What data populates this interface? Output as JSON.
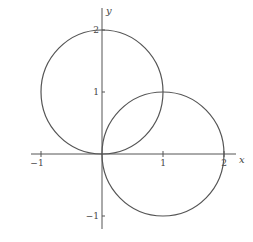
{
  "chart_data": {
    "type": "line",
    "title": "",
    "xlabel": "x",
    "ylabel": "y",
    "xlim": [
      -1.2,
      2.2
    ],
    "ylim": [
      -1.2,
      2.3
    ],
    "grid": false,
    "legend": null,
    "x_ticks": [
      {
        "value": -1,
        "label": "−1"
      },
      {
        "value": 1,
        "label": "1"
      },
      {
        "value": 2,
        "label": "2"
      }
    ],
    "y_ticks": [
      {
        "value": -1,
        "label": "−1"
      },
      {
        "value": 1,
        "label": "1"
      },
      {
        "value": 2,
        "label": "2"
      }
    ],
    "series": [
      {
        "name": "circle-upper-left",
        "shape": "circle",
        "center": [
          0,
          1
        ],
        "radius": 1
      },
      {
        "name": "circle-lower-right",
        "shape": "circle",
        "center": [
          1,
          0
        ],
        "radius": 1
      }
    ],
    "color": "#555555"
  }
}
